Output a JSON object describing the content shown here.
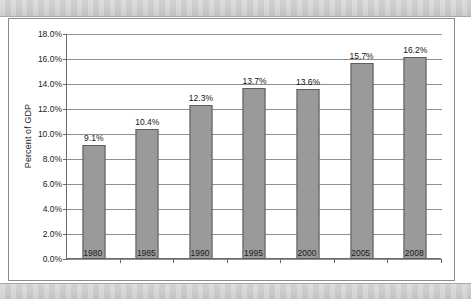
{
  "chart_data": {
    "type": "bar",
    "title": "",
    "xlabel": "",
    "ylabel": "Percent of GDP",
    "categories": [
      "1980",
      "1985",
      "1990",
      "1995",
      "2000",
      "2005",
      "2008"
    ],
    "values": [
      9.1,
      10.4,
      12.3,
      13.7,
      13.6,
      15.7,
      16.2
    ],
    "data_labels": [
      "9.1%",
      "10.4%",
      "12.3%",
      "13.7%",
      "13.6%",
      "15.7%",
      "16.2%"
    ],
    "ylim": [
      0,
      18
    ],
    "ytick_values": [
      0,
      2,
      4,
      6,
      8,
      10,
      12,
      14,
      16,
      18
    ],
    "ytick_labels": [
      "0.0%",
      "2.0%",
      "4.0%",
      "6.0%",
      "8.0%",
      "10.0%",
      "12.0%",
      "14.0%",
      "16.0%",
      "18.0%"
    ],
    "grid": true,
    "legend": null,
    "series": [
      {
        "name": "Percent of GDP",
        "values": [
          9.1,
          10.4,
          12.3,
          13.7,
          13.6,
          15.7,
          16.2
        ]
      }
    ],
    "colors": {
      "bar_fill": "#9a9a9a",
      "bar_stroke": "#5d5d5d",
      "gridline": "#8f8f8f",
      "axis": "#6a6a6a",
      "text": "#1b1b1b",
      "plot_background": "#ffffff",
      "page_background": "#ffffff",
      "scan_band": "#cfcfcf",
      "frame_border": "#8b8b8b"
    }
  }
}
